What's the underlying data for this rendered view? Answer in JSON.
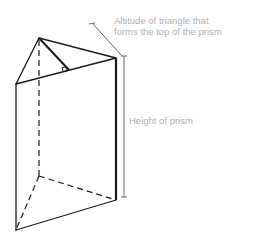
{
  "figure": {
    "labels": {
      "altitude_line1": "Altitude of triangle that",
      "altitude_line2": "forms the top of the prism",
      "height": "Height of prism"
    },
    "colors": {
      "line": "#1a1a1a",
      "label_text": "#b0b0b0",
      "background": "#ffffff"
    },
    "vertices": {
      "top_apex": [
        39,
        38
      ],
      "top_left": [
        16,
        84
      ],
      "top_right": [
        116,
        58
      ],
      "bottom_back": [
        39,
        176
      ],
      "bottom_left": [
        16,
        230
      ],
      "bottom_right": [
        116,
        200
      ],
      "altitude_foot": [
        69,
        70
      ]
    }
  }
}
